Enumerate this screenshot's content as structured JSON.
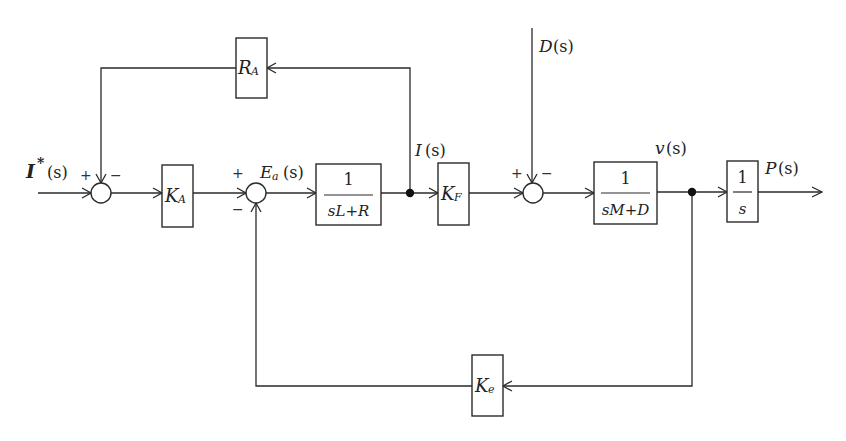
{
  "diagram": {
    "type": "control-system-block-diagram",
    "colors": {
      "line": "#2a2a2a",
      "background": "#ffffff",
      "text": "#222222"
    },
    "signals": {
      "input": {
        "symbol": "I",
        "superscript": "*",
        "arg": "(s)"
      },
      "error": {
        "symbol": "E",
        "subscript": "a",
        "arg": "(s)"
      },
      "current": {
        "symbol": "I",
        "arg": "(s)"
      },
      "disturbance": {
        "symbol": "D",
        "arg": "(s)"
      },
      "velocity": {
        "symbol": "v",
        "arg": "(s)"
      },
      "output": {
        "symbol": "P",
        "arg": "(s)"
      }
    },
    "blocks": {
      "ka": {
        "symbol": "K",
        "subscript": "A"
      },
      "plant_electrical": {
        "numerator": "1",
        "denominator": "sL+R"
      },
      "kf": {
        "symbol": "K",
        "subscript": "F"
      },
      "plant_mechanical": {
        "numerator": "1",
        "denominator": "sM+D"
      },
      "integrator": {
        "numerator": "1",
        "denominator": "s"
      },
      "ra": {
        "symbol": "R",
        "subscript": "A"
      },
      "ke": {
        "symbol": "K",
        "subscript": "e"
      }
    },
    "summing_junctions": {
      "sum1": {
        "plus": "+",
        "minus": "−"
      },
      "sum2": {
        "plus": "+",
        "minus": "−"
      },
      "sum3": {
        "plus": "+",
        "minus": "−"
      }
    }
  }
}
